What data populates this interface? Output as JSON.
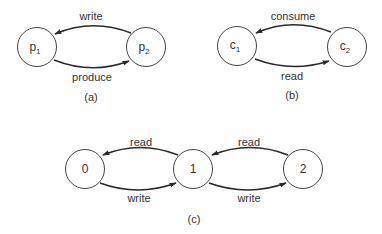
{
  "diagrams": {
    "a": {
      "caption": "(a)",
      "nodes": [
        {
          "id": "p1",
          "base": "p",
          "sub": "1"
        },
        {
          "id": "p2",
          "base": "p",
          "sub": "2"
        }
      ],
      "edges": [
        {
          "from": "p2",
          "to": "p1",
          "label": "write"
        },
        {
          "from": "p1",
          "to": "p2",
          "label": "produce"
        }
      ]
    },
    "b": {
      "caption": "(b)",
      "nodes": [
        {
          "id": "c1",
          "base": "c",
          "sub": "1"
        },
        {
          "id": "c2",
          "base": "c",
          "sub": "2"
        }
      ],
      "edges": [
        {
          "from": "c2",
          "to": "c1",
          "label": "consume"
        },
        {
          "from": "c1",
          "to": "c2",
          "label": "read"
        }
      ]
    },
    "c": {
      "caption": "(c)",
      "nodes": [
        {
          "id": "0",
          "label": "0"
        },
        {
          "id": "1",
          "label": "1"
        },
        {
          "id": "2",
          "label": "2"
        }
      ],
      "edges": [
        {
          "from": "1",
          "to": "0",
          "label": "read"
        },
        {
          "from": "0",
          "to": "1",
          "label": "write"
        },
        {
          "from": "2",
          "to": "1",
          "label": "read"
        },
        {
          "from": "1",
          "to": "2",
          "label": "write"
        }
      ]
    }
  },
  "colors": {
    "stroke": "#2a2a2a",
    "text": "#333333",
    "background": "#ffffff"
  }
}
